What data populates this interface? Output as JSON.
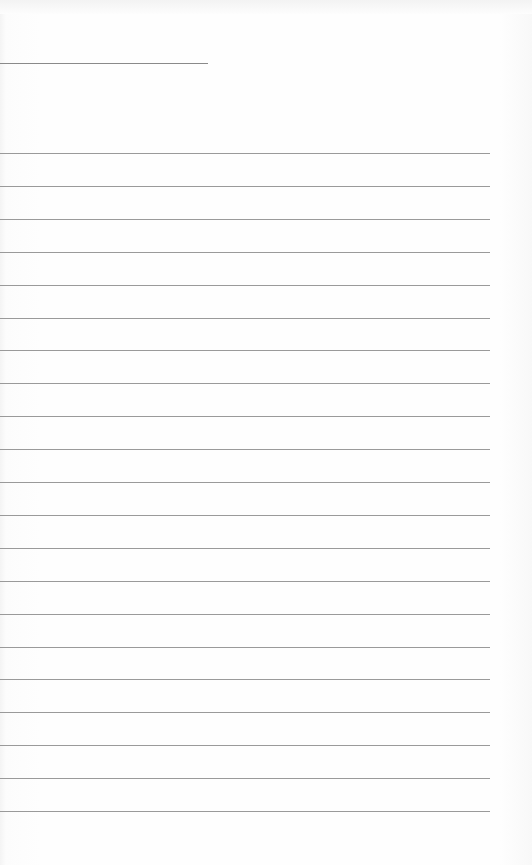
{
  "page": {
    "type": "lined-notepad-page",
    "background_color": "#fdfdfd",
    "line_color": "#9a9a9a"
  },
  "header_line": {
    "top": 63,
    "width": 208
  },
  "ruled_lines": {
    "count": 21,
    "first_top": 153,
    "spacing": 32.9,
    "width": 490
  }
}
